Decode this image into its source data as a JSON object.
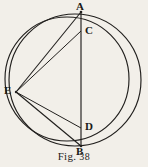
{
  "figure": {
    "caption_prefix": "Fig.",
    "caption_number": "38",
    "caption_full": "Fig. 38",
    "stroke_color": "#211f1d",
    "background_color": "#f2efe9",
    "label_color": "#1b1a18",
    "points": [
      {
        "id": "A",
        "label": "A",
        "x": 81,
        "y": 12,
        "label_x": 76,
        "label_y": 2
      },
      {
        "id": "C",
        "label": "C",
        "x": 81,
        "y": 31,
        "label_x": 85,
        "label_y": 26
      },
      {
        "id": "E",
        "label": "E",
        "x": 16,
        "y": 92,
        "label_x": 5,
        "label_y": 85
      },
      {
        "id": "D",
        "label": "D",
        "x": 81,
        "y": 128,
        "label_x": 85,
        "label_y": 122
      },
      {
        "id": "B",
        "label": "B",
        "x": 81,
        "y": 146,
        "label_x": 76,
        "label_y": 148
      }
    ],
    "circles": [
      {
        "id": "outer-circle",
        "cx": 75,
        "cy": 80,
        "r": 66
      },
      {
        "id": "inner-circle",
        "cx": 67,
        "cy": 79,
        "r": 62
      }
    ],
    "segments": [
      {
        "id": "diameter-AB",
        "from": "A",
        "to": "B"
      },
      {
        "id": "chord-AE",
        "from": "A",
        "to": "E"
      },
      {
        "id": "chord-EB",
        "from": "E",
        "to": "B"
      },
      {
        "id": "chord-EC",
        "from": "E",
        "to": "C"
      },
      {
        "id": "chord-ED",
        "from": "E",
        "to": "D"
      }
    ]
  }
}
